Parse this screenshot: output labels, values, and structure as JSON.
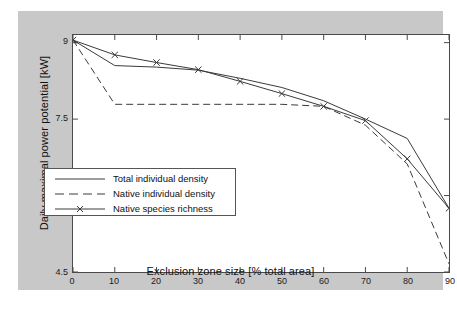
{
  "chart_data": {
    "type": "line",
    "title": "",
    "xlabel": "Exclusion zone size [% total area]",
    "ylabel": "Daily maximal power potential [kW]",
    "xlim": [
      0,
      90
    ],
    "ylim": [
      4.5,
      9.15
    ],
    "xticks": [
      0,
      10,
      20,
      30,
      40,
      50,
      60,
      70,
      80,
      90
    ],
    "xtick_labels": [
      "0",
      "10",
      "20",
      "30",
      "40",
      "50",
      "60",
      "70",
      "80",
      "90"
    ],
    "yticks": [
      4.5,
      6,
      7.5,
      9
    ],
    "ytick_labels": [
      "4.5",
      "6",
      "7.5",
      "9"
    ],
    "grid": false,
    "legend_position": "lower-left-inside",
    "x": [
      0,
      10,
      20,
      30,
      40,
      50,
      60,
      70,
      80,
      90
    ],
    "series": [
      {
        "name": "Total individual density",
        "style": "solid",
        "marker": "none",
        "color": "#3a3a3a",
        "values": [
          9.05,
          8.55,
          8.52,
          8.46,
          8.3,
          8.12,
          7.86,
          7.5,
          7.12,
          5.75
        ]
      },
      {
        "name": "Native individual density",
        "style": "dashed",
        "marker": "none",
        "color": "#3a3a3a",
        "values": [
          9.05,
          7.79,
          7.79,
          7.79,
          7.79,
          7.79,
          7.75,
          7.38,
          6.62,
          4.66
        ]
      },
      {
        "name": "Native species richness",
        "style": "solid",
        "marker": "x",
        "color": "#3a3a3a",
        "values": [
          9.05,
          8.76,
          8.61,
          8.47,
          8.24,
          8.0,
          7.75,
          7.47,
          6.72,
          5.75
        ]
      }
    ]
  },
  "legend": {
    "entries": [
      {
        "label": "Total individual density"
      },
      {
        "label": "Native individual density"
      },
      {
        "label": "Native species richness"
      }
    ]
  },
  "axes": {
    "x_title": "Exclusion zone size [% total area]",
    "y_title": "Daily maximal power potential [kW]"
  }
}
